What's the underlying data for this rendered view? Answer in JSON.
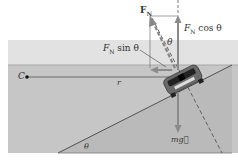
{
  "diagram": {
    "labels": {
      "normal_force": "F⃗N",
      "normal_force_main": "F",
      "normal_force_sub": "N",
      "vertical_component": "FN cos θ",
      "vertical_component_main": "F",
      "vertical_component_sub": "N",
      "vertical_component_tail": " cos θ",
      "horizontal_component_main": "F",
      "horizontal_component_sub": "N",
      "horizontal_component_tail": " sin θ",
      "angle_top": "θ",
      "angle_bottom": "θ",
      "center": "C",
      "radius": "r",
      "weight": "mg⃗"
    },
    "colors": {
      "sky_panel": "#e4e4e4",
      "flat_ground": "#c4c4c4",
      "incline": "#b8b8b8",
      "arrow": "#8a8a8a",
      "line": "#444444"
    }
  }
}
